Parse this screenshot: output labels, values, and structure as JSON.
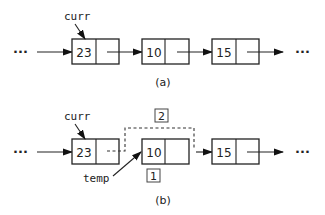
{
  "diagram": {
    "panel_a": {
      "caption": "(a)",
      "pointer_label": "curr",
      "ellipsis_left": "···",
      "ellipsis_right": "···",
      "nodes": [
        {
          "value": "23"
        },
        {
          "value": "10"
        },
        {
          "value": "15"
        }
      ]
    },
    "panel_b": {
      "caption": "(b)",
      "pointer_label": "curr",
      "temp_label": "temp",
      "step_labels": [
        "1",
        "2"
      ],
      "ellipsis_left": "···",
      "ellipsis_right": "···",
      "nodes": [
        {
          "value": "23"
        },
        {
          "value": "10"
        },
        {
          "value": "15"
        }
      ]
    }
  }
}
